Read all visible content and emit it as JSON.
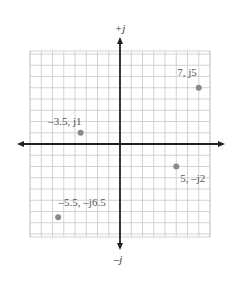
{
  "chart_data": {
    "type": "scatter",
    "title": "",
    "xlabel": "",
    "ylabel": "",
    "axis_labels": {
      "positive_imag": "+j",
      "negative_imag": "–j"
    },
    "xlim": [
      -8,
      8
    ],
    "ylim": [
      -8,
      8
    ],
    "grid": true,
    "points": [
      {
        "label": "7, j5",
        "x": 7,
        "y": 5
      },
      {
        "label": "–3.5, j1",
        "x": -3.5,
        "y": 1
      },
      {
        "label": "5, –j2",
        "x": 5,
        "y": -2
      },
      {
        "label": "–5.5, –j6.5",
        "x": -5.5,
        "y": -6.5
      }
    ],
    "colors": {
      "grid": "#c8c8c8",
      "axis": "#222222",
      "point": "#8a8a8a",
      "label": "#555555"
    }
  }
}
